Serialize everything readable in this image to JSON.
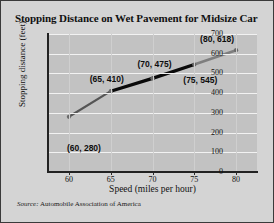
{
  "figure": {
    "title": "Stopping Distance on Wet Pavement for Midsize Car",
    "source_lead": "Source:",
    "source_text": "Automobile Association of America",
    "background_color": "#d4d4d4",
    "plot_background_color": "#c2c2c2",
    "border_color": "#3a3a3a"
  },
  "chart_data": {
    "type": "line",
    "title": "Stopping Distance on Wet Pavement for Midsize Car",
    "xlabel": "Speed (miles per hour)",
    "ylabel": "Stopping distance (feet)",
    "xlim": [
      57.5,
      82.5
    ],
    "ylim": [
      0,
      700
    ],
    "grid": true,
    "legend": "none",
    "x": [
      60,
      65,
      70,
      75,
      80
    ],
    "values": [
      280,
      410,
      475,
      545,
      618
    ],
    "xticks": [
      60,
      65,
      70,
      75,
      80
    ],
    "yticks": [
      0,
      100,
      200,
      300,
      400,
      500,
      600,
      700
    ],
    "xtick_labels": [
      "60",
      "65",
      "70",
      "75",
      "80"
    ],
    "ytick_labels": [
      "0",
      "100",
      "200",
      "300",
      "400",
      "500",
      "600",
      "700"
    ],
    "point_labels": [
      "(60, 280)",
      "(65, 410)",
      "(70, 475)",
      "(75, 545)",
      "(80, 618)"
    ],
    "segments": [
      {
        "from": 60,
        "to": 65,
        "color": "#555555",
        "width": 2.2
      },
      {
        "from": 65,
        "to": 70,
        "color": "#0a0a0a",
        "width": 3.2
      },
      {
        "from": 70,
        "to": 75,
        "color": "#0a0a0a",
        "width": 3.2
      },
      {
        "from": 75,
        "to": 80,
        "color": "#7e7e7e",
        "width": 2.6
      }
    ],
    "marker_color": "#6a6a6a",
    "source": "Source: Automobile Association of America"
  }
}
